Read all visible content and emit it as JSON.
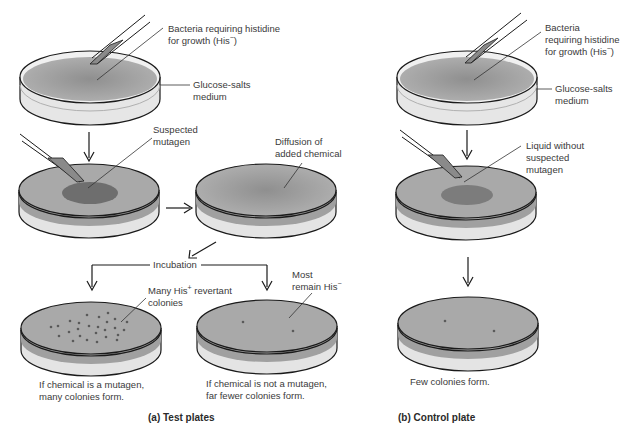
{
  "figure": {
    "panels": [
      {
        "id": "a",
        "caption": "(a) Test plates",
        "labels": {
          "bacteria_line1": "Bacteria requiring histidine",
          "bacteria_line2": "for growth (His",
          "bacteria_line2_sup": "−",
          "bacteria_line2_end": ")",
          "medium_line1": "Glucose-salts",
          "medium_line2": "medium",
          "mutagen_line1": "Suspected",
          "mutagen_line2": "mutagen",
          "diffusion_line1": "Diffusion of",
          "diffusion_line2": "added chemical",
          "incubation": "Incubation",
          "revertant_line1_a": "Many His",
          "revertant_line1_sup": "+",
          "revertant_line1_b": " revertant",
          "revertant_line2": "colonies",
          "most_line1": "Most",
          "most_line2": "remain His",
          "most_line2_sup": "−",
          "result_mutagen_line1": "If chemical is a mutagen,",
          "result_mutagen_line2": "many colonies form.",
          "result_not_line1": "If chemical is not a mutagen,",
          "result_not_line2": "far fewer colonies form."
        }
      },
      {
        "id": "b",
        "caption": "(b) Control plate",
        "labels": {
          "bacteria_line1": "Bacteria",
          "bacteria_line2": "requiring histidine",
          "bacteria_line3": "for growth (His",
          "bacteria_line3_sup": "−",
          "bacteria_line3_end": ")",
          "medium_line1": "Glucose-salts",
          "medium_line2": "medium",
          "liquid_line1": "Liquid without",
          "liquid_line2": "suspected",
          "liquid_line3": "mutagen",
          "result_line1": "Few colonies form."
        }
      }
    ],
    "colors": {
      "agar_top": "#a9a9a9",
      "agar_center": "#8f8f8f",
      "agar_side": "#9a9a9a",
      "plate_wall": "#e2e2e2",
      "mutagen_spot": "#6e6e6e",
      "colony": "#5a5a5a",
      "outline": "#1a1a1a"
    }
  }
}
